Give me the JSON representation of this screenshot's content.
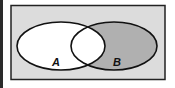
{
  "diagram": {
    "type": "venn",
    "universe": {
      "fill": "#dcdcdc",
      "stroke": "#222222"
    },
    "sets": [
      {
        "label": "A",
        "fill": "#ffffff"
      },
      {
        "label": "B",
        "fill": "#b0b0b0"
      }
    ],
    "intersection": {
      "fill": "#ffffff"
    },
    "shaded_region": "B minus A"
  }
}
